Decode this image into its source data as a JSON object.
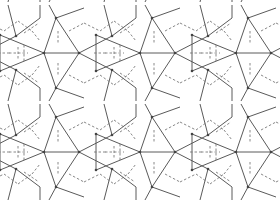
{
  "figure": {
    "type": "tiling-diagram",
    "colors": {
      "background": "#ffffff",
      "solid_edge": "#5a5a5a",
      "dashed_edge": "#6a6a6a",
      "node": "#444444"
    },
    "tile": {
      "period_x": 96,
      "period_y": 99,
      "offset_x": 44,
      "offset_y": 53
    }
  }
}
